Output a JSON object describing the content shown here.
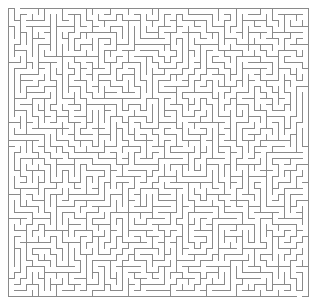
{
  "figure": {
    "kind": "maze-puzzle",
    "width_px": 319,
    "height_px": 306,
    "background_color": "#ffffff"
  },
  "maze": {
    "columns": 50,
    "rows": 48,
    "cell_size_px": 6,
    "origin_x_px": 8,
    "origin_y_px": 8,
    "wall_color": "#8a8a8a",
    "wall_thickness_px": 1,
    "passage_color": "#ffffff",
    "algorithm": "recursive-backtracker",
    "seed": 20240517,
    "perfect": true,
    "entrance": {
      "side": "top",
      "cell_column": 1,
      "label": "entrance"
    },
    "exit": {
      "side": "bottom",
      "cell_column": 48,
      "label": "exit"
    },
    "border": {
      "top": true,
      "right": true,
      "bottom": true,
      "left": true
    }
  }
}
